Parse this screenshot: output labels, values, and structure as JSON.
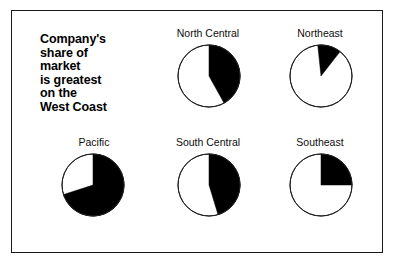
{
  "figure": {
    "headline_lines": [
      "Company's",
      "share of",
      "market",
      "is greatest",
      "on the",
      "West Coast"
    ],
    "frame_color": "#1a1a1a",
    "slice_color": "#000000",
    "background_color": "#ffffff"
  },
  "chart_data": {
    "type": "pie",
    "title": "Company's share of market is greatest on the West Coast",
    "note": "Six-panel small-multiple of single-company market share by U.S. region; filled black wedge = company's share, white remainder = rest of market. Wedges start at 12 o'clock and sweep clockwise.",
    "legend": [
      "Company share (black)",
      "Remainder of market (white)"
    ],
    "value_unit": "percent",
    "panels": [
      {
        "label": "North Central",
        "share_percent": 42,
        "remainder_percent": 58,
        "start_angle_deg": 0,
        "sweep_deg": 151,
        "row": 0,
        "column": 1
      },
      {
        "label": "Northeast",
        "share_percent": 12,
        "remainder_percent": 88,
        "start_angle_deg": -6,
        "sweep_deg": 44,
        "row": 0,
        "column": 2
      },
      {
        "label": "Pacific",
        "share_percent": 70,
        "remainder_percent": 30,
        "start_angle_deg": 0,
        "sweep_deg": 252,
        "row": 1,
        "column": 0
      },
      {
        "label": "South Central",
        "share_percent": 45,
        "remainder_percent": 55,
        "start_angle_deg": 0,
        "sweep_deg": 163,
        "row": 1,
        "column": 1
      },
      {
        "label": "Southeast",
        "share_percent": 25,
        "remainder_percent": 75,
        "start_angle_deg": 0,
        "sweep_deg": 90,
        "row": 1,
        "column": 2
      }
    ]
  }
}
